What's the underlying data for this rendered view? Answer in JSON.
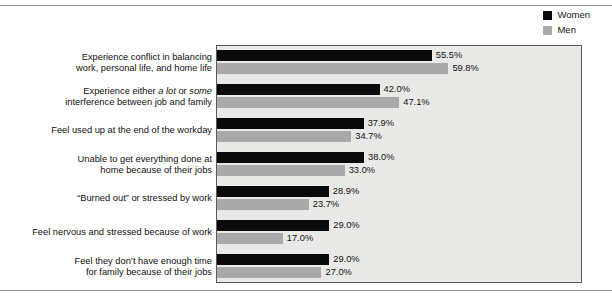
{
  "legend": {
    "position": "top-right",
    "entries": [
      {
        "label": "Women",
        "color": "#0a0a0a",
        "swatch_name": "legend-swatch-women"
      },
      {
        "label": "Men",
        "color": "#a9a9a9",
        "swatch_name": "legend-swatch-men"
      }
    ]
  },
  "chart_data": {
    "type": "bar",
    "orientation": "horizontal",
    "title": "",
    "subtitle": "",
    "xlabel": "",
    "ylabel": "",
    "xlim": [
      0,
      94.5
    ],
    "grid": false,
    "legend_position": "top-right",
    "value_suffix": "%",
    "categories": [
      "Experience conflict in balancing work, personal life, and home life",
      "Experience either a lot or some interference between job and family",
      "Feel used up at the end of the workday",
      "Unable to get everything done at home because of their jobs",
      "“Burned out” or stressed by work",
      "Feel nervous and stressed because of work",
      "Feel they don’t have enough time for family because of their jobs"
    ],
    "series": [
      {
        "name": "Women",
        "color": "#0a0a0a",
        "values": [
          55.5,
          42.0,
          37.9,
          38.0,
          28.9,
          29.0,
          29.0
        ]
      },
      {
        "name": "Men",
        "color": "#a9a9a9",
        "values": [
          59.8,
          47.1,
          34.7,
          33.0,
          23.7,
          17.0,
          27.0
        ]
      }
    ],
    "value_labels": {
      "Women": [
        "55.5%",
        "42.0%",
        "37.9%",
        "38.0%",
        "28.9%",
        "29.0%",
        "29.0%"
      ],
      "Men": [
        "59.8%",
        "47.1%",
        "34.7%",
        "33.0%",
        "23.7%",
        "17.0%",
        "27.0%"
      ]
    }
  },
  "categories_rich": [
    {
      "lines": [
        [
          {
            "t": "Experience conflict in balancing",
            "i": false
          }
        ],
        [
          {
            "t": "work, personal life, and home life",
            "i": false
          }
        ]
      ]
    },
    {
      "lines": [
        [
          {
            "t": "Experience either ",
            "i": false
          },
          {
            "t": "a lot",
            "i": true
          },
          {
            "t": " or ",
            "i": false
          },
          {
            "t": "some",
            "i": true
          }
        ],
        [
          {
            "t": "interference between job and family",
            "i": false
          }
        ]
      ]
    },
    {
      "lines": [
        [
          {
            "t": "Feel used up at the end of the workday",
            "i": false
          }
        ]
      ]
    },
    {
      "lines": [
        [
          {
            "t": "Unable to get everything done at",
            "i": false
          }
        ],
        [
          {
            "t": "home because of their jobs",
            "i": false
          }
        ]
      ]
    },
    {
      "lines": [
        [
          {
            "t": "“Burned out” or stressed by work",
            "i": false
          }
        ]
      ]
    },
    {
      "lines": [
        [
          {
            "t": "Feel nervous and stressed because of work",
            "i": false
          }
        ]
      ]
    },
    {
      "lines": [
        [
          {
            "t": "Feel they don’t have enough time",
            "i": false
          }
        ],
        [
          {
            "t": "for family because of their jobs",
            "i": false
          }
        ]
      ]
    }
  ],
  "style": {
    "plot_background": "#e9e9e7",
    "plot_border": "#5a5a5a",
    "rule_color": "#8d8d8d",
    "text_color": "#111111",
    "px_per_percent": 3.87,
    "bar_height_px": 11,
    "row_height_px": 34,
    "plot_top_px": 45
  }
}
